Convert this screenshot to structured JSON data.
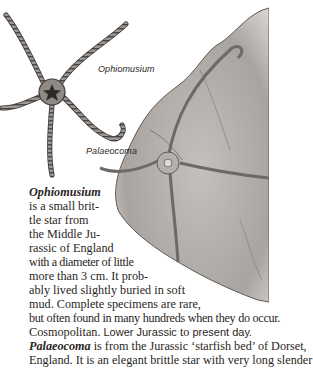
{
  "illustration": {
    "labels": [
      {
        "text": "Ophiomusium",
        "x": 98,
        "y": 64
      },
      {
        "text": "Palaeocoma",
        "x": 86,
        "y": 146
      }
    ],
    "colors": {
      "rock": "#b9b5b0",
      "rock_shadow": "#7d7873",
      "star_body": "#8a8580",
      "outline": "#3a3633"
    }
  },
  "body_text": {
    "lines": [
      {
        "parts": [
          {
            "text": "Ophiomusium",
            "style": "bi"
          }
        ]
      },
      {
        "parts": [
          {
            "text": "is a small brit-"
          }
        ]
      },
      {
        "parts": [
          {
            "text": "tle star from"
          }
        ]
      },
      {
        "parts": [
          {
            "text": "the Middle Ju-"
          }
        ]
      },
      {
        "parts": [
          {
            "text": "rassic of England"
          }
        ]
      },
      {
        "parts": [
          {
            "text": "with a diameter of little"
          }
        ]
      },
      {
        "parts": [
          {
            "text": "more than 3 cm. It prob-"
          }
        ]
      },
      {
        "parts": [
          {
            "text": "ably lived slightly buried in soft"
          }
        ]
      },
      {
        "parts": [
          {
            "text": "mud. Complete specimens are rare,"
          }
        ]
      },
      {
        "parts": [
          {
            "text": "but often found in many hundreds when they do occur."
          }
        ]
      },
      {
        "parts": [
          {
            "text": "Cosmopolitan. "
          },
          {
            "text": "Lower Jurassic",
            "style": "sans"
          },
          {
            "text": " to "
          },
          {
            "text": "present day.",
            "style": "sans"
          }
        ]
      },
      {
        "parts": [
          {
            "text": "Palaeocoma",
            "style": "bi"
          },
          {
            "text": " is from the Jurassic ‘starfish bed’ of Dorset,"
          }
        ]
      },
      {
        "parts": [
          {
            "text": "England. It is an elegant brittle star with very long slender"
          }
        ]
      }
    ]
  }
}
